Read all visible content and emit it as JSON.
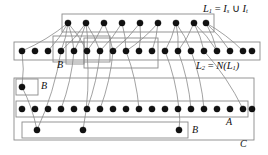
{
  "figure": {
    "name": "layered-graph-diagram",
    "type": "node-link-diagram",
    "background": "#ffffff",
    "node_color": "#111111",
    "box_stroke": "#8a8a8a",
    "edge_stroke": "#555555",
    "width": 268,
    "height": 155
  },
  "labels": {
    "l1": {
      "base": "L",
      "sub": "1",
      "eq": " = ",
      "i_s_base": "I",
      "i_s_sub": "s",
      "cup": " ∪ ",
      "i_t_base": "I",
      "i_t_sub": "t"
    },
    "l2": {
      "base": "L",
      "sub": "2",
      "eq": " = ",
      "n": "N(",
      "inner_base": "L",
      "inner_sub": "1",
      "close": ")"
    },
    "b_row2": "B",
    "b_left": "B",
    "b_bottom": "B",
    "a": "A",
    "c": "C"
  },
  "chart_data": {
    "type": "scatter",
    "title": "",
    "rows": [
      {
        "id": "L1",
        "label": "L1 = Is ∪ It",
        "y": 23,
        "count": 9,
        "x": [
          68,
          86,
          104,
          122,
          140,
          158,
          176,
          194,
          206
        ]
      },
      {
        "id": "L2",
        "label": "L2 = N(L1)",
        "y": 51,
        "count": 19,
        "x": [
          22,
          35,
          48,
          61,
          74,
          87,
          100,
          113,
          126,
          139,
          152,
          165,
          178,
          191,
          204,
          217,
          230,
          243,
          252
        ]
      },
      {
        "id": "A",
        "label": "A",
        "y": 109,
        "count": 19,
        "x": [
          22,
          35,
          48,
          61,
          74,
          87,
          100,
          113,
          126,
          139,
          152,
          165,
          178,
          191,
          204,
          217,
          230,
          243,
          252
        ]
      },
      {
        "id": "B-left",
        "label": "B",
        "y": 87,
        "count": 1,
        "x": [
          22
        ]
      },
      {
        "id": "B-bottom",
        "label": "B",
        "y": 130,
        "count": 3,
        "x": [
          37,
          83,
          179
        ]
      }
    ],
    "boxes": [
      {
        "id": "L1-box",
        "x": 62,
        "y": 14,
        "w": 152,
        "h": 18
      },
      {
        "id": "L2-box",
        "x": 14,
        "y": 42,
        "w": 246,
        "h": 18
      },
      {
        "id": "C-box",
        "x": 14,
        "y": 78,
        "w": 240,
        "h": 62
      },
      {
        "id": "A-box",
        "x": 16,
        "y": 101,
        "w": 232,
        "h": 16
      },
      {
        "id": "Bleft-box",
        "x": 16,
        "y": 79,
        "w": 22,
        "h": 16
      },
      {
        "id": "Bbottom-box",
        "x": 22,
        "y": 122,
        "w": 166,
        "h": 16
      },
      {
        "id": "sub-box-1",
        "x": 53,
        "y": 36,
        "w": 57,
        "h": 26
      },
      {
        "id": "sub-box-2",
        "x": 66,
        "y": 42,
        "w": 18,
        "h": 22
      },
      {
        "id": "sub-box-3",
        "x": 84,
        "y": 38,
        "w": 74,
        "h": 30
      }
    ],
    "edges": [
      [
        68,
        23,
        22,
        51
      ],
      [
        68,
        23,
        48,
        51
      ],
      [
        68,
        23,
        61,
        51
      ],
      [
        68,
        23,
        74,
        51
      ],
      [
        68,
        23,
        87,
        51
      ],
      [
        86,
        23,
        61,
        51
      ],
      [
        86,
        23,
        74,
        51
      ],
      [
        86,
        23,
        87,
        51
      ],
      [
        86,
        23,
        100,
        51
      ],
      [
        104,
        23,
        87,
        51
      ],
      [
        104,
        23,
        113,
        51
      ],
      [
        122,
        23,
        100,
        51
      ],
      [
        122,
        23,
        126,
        51
      ],
      [
        140,
        23,
        113,
        51
      ],
      [
        140,
        23,
        139,
        51
      ],
      [
        158,
        23,
        126,
        51
      ],
      [
        158,
        23,
        152,
        51
      ],
      [
        176,
        23,
        165,
        51
      ],
      [
        176,
        23,
        178,
        51
      ],
      [
        176,
        23,
        191,
        51
      ],
      [
        194,
        23,
        178,
        51
      ],
      [
        194,
        23,
        204,
        51
      ],
      [
        194,
        23,
        217,
        51
      ],
      [
        206,
        23,
        217,
        51
      ],
      [
        206,
        23,
        230,
        51
      ],
      [
        206,
        23,
        243,
        51
      ],
      [
        22,
        51,
        22,
        87
      ],
      [
        61,
        51,
        37,
        130
      ],
      [
        74,
        51,
        61,
        109
      ],
      [
        87,
        51,
        83,
        130
      ],
      [
        100,
        51,
        87,
        109
      ],
      [
        113,
        51,
        100,
        109
      ],
      [
        126,
        51,
        139,
        109
      ],
      [
        165,
        51,
        179,
        109
      ],
      [
        178,
        51,
        191,
        109
      ],
      [
        191,
        51,
        204,
        109
      ],
      [
        204,
        51,
        243,
        109
      ],
      [
        22,
        87,
        37,
        130
      ],
      [
        179,
        109,
        179,
        130
      ]
    ]
  }
}
